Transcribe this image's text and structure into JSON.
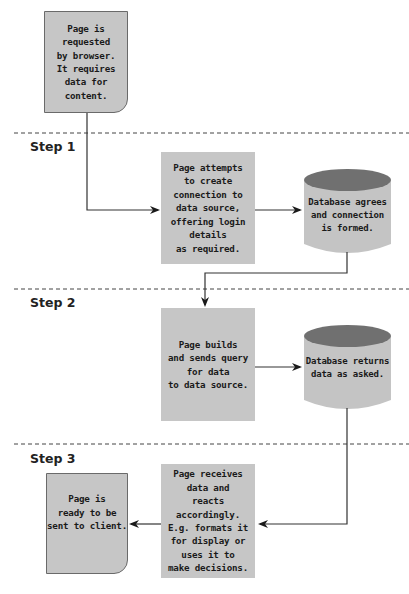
{
  "diagram": {
    "colors": {
      "box_fill": "#c6c6c6",
      "cylinder_body": "#c4c4c4",
      "cylinder_top": "#707070",
      "line": "#333333",
      "dashed_line": "#444444"
    },
    "steps": [
      {
        "label": "Step 1"
      },
      {
        "label": "Step 2"
      },
      {
        "label": "Step 3"
      }
    ],
    "nodes": {
      "start_page": {
        "text": "Page is\nrequested\nby browser.\nIt requires\ndata for\ncontent."
      },
      "step1_page": {
        "text": "Page attempts\nto create\nconnection to\ndata source,\noffering login\ndetails\nas required."
      },
      "step1_db": {
        "text": "Database agrees\nand connection\nis formed."
      },
      "step2_page": {
        "text": "Page builds\nand sends query\nfor data\nto data source."
      },
      "step2_db": {
        "text": "Database returns\ndata as asked."
      },
      "step3_page": {
        "text": "Page receives\ndata and\nreacts accordingly.\nE.g. formats it\nfor display or\nuses it to\nmake decisions."
      },
      "end_page": {
        "text": "Page is\nready to be\nsent to client."
      }
    }
  }
}
